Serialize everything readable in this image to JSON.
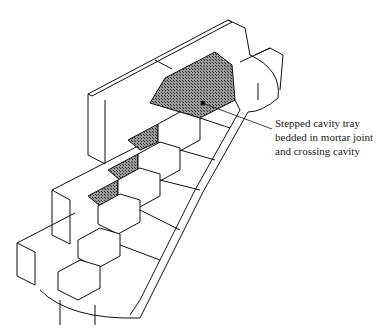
{
  "diagram": {
    "callout": {
      "lines": [
        "Stepped cavity tray",
        "bedded in mortar joint",
        "and crossing cavity"
      ]
    },
    "colors": {
      "line": "#111111",
      "hatch": "#6e6e6e",
      "background": "#ffffff"
    }
  }
}
